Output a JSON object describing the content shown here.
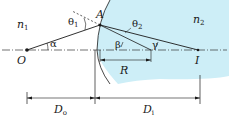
{
  "diagram": {
    "colors": {
      "medium2_fill": "#cdeef7",
      "line": "#1a1a1a",
      "axis": "#333333"
    },
    "labels": {
      "n1": "n",
      "n1_sub": "1",
      "n2": "n",
      "n2_sub": "2",
      "point_A": "A",
      "point_O": "O",
      "point_I": "I",
      "theta1": "θ",
      "theta1_sub": "1",
      "theta2": "θ",
      "theta2_sub": "2",
      "alpha": "α",
      "beta": "β",
      "gamma": "γ",
      "R": "R",
      "Do": "D",
      "Do_sub": "o",
      "Di": "D",
      "Di_sub": "i"
    }
  }
}
